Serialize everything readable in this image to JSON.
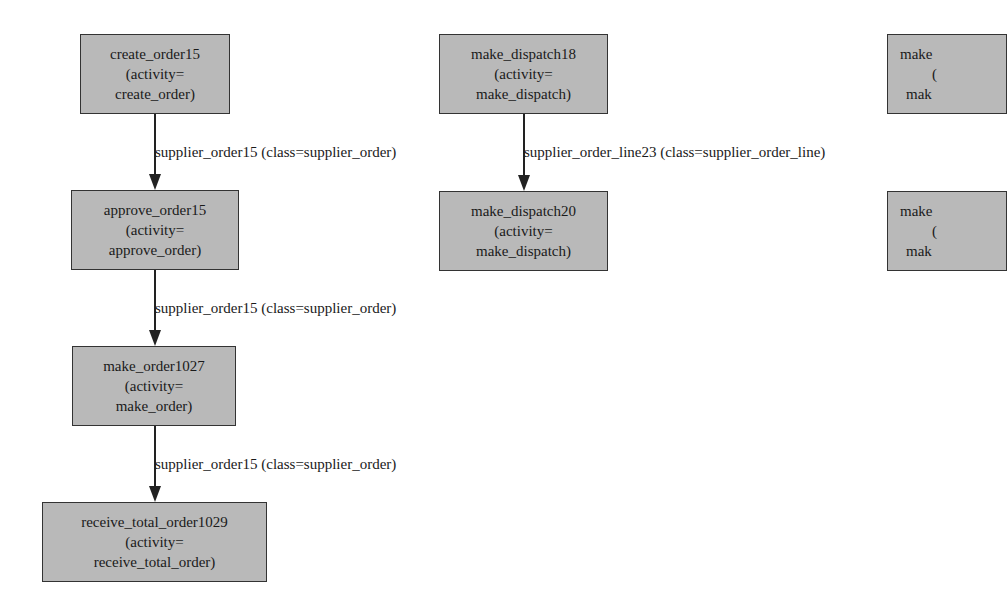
{
  "nodes": [
    {
      "id": "create_order15",
      "line1": "create_order15",
      "line2": "(activity=",
      "line3": "create_order)"
    },
    {
      "id": "approve_order15",
      "line1": "approve_order15",
      "line2": "(activity=",
      "line3": "approve_order)"
    },
    {
      "id": "make_order1027",
      "line1": "make_order1027",
      "line2": "(activity=",
      "line3": "make_order)"
    },
    {
      "id": "receive_total_order1029",
      "line1": "receive_total_order1029",
      "line2": "(activity=",
      "line3": "receive_total_order)"
    },
    {
      "id": "make_dispatch18",
      "line1": "make_dispatch18",
      "line2": "(activity=",
      "line3": "make_dispatch)"
    },
    {
      "id": "make_dispatch20",
      "line1": "make_dispatch20",
      "line2": "(activity=",
      "line3": "make_dispatch)"
    },
    {
      "id": "partial_top_right",
      "line1": "make",
      "line2": "(",
      "line3": "mak"
    },
    {
      "id": "partial_bottom_right",
      "line1": "make",
      "line2": "(",
      "line3": "mak"
    }
  ],
  "edges": [
    {
      "from": "create_order15",
      "to": "approve_order15",
      "label": "supplier_order15 (class=supplier_order)"
    },
    {
      "from": "approve_order15",
      "to": "make_order1027",
      "label": "supplier_order15 (class=supplier_order)"
    },
    {
      "from": "make_order1027",
      "to": "receive_total_order1029",
      "label": "supplier_order15 (class=supplier_order)"
    },
    {
      "from": "make_dispatch18",
      "to": "make_dispatch20",
      "label": "supplier_order_line23 (class=supplier_order_line)"
    }
  ]
}
